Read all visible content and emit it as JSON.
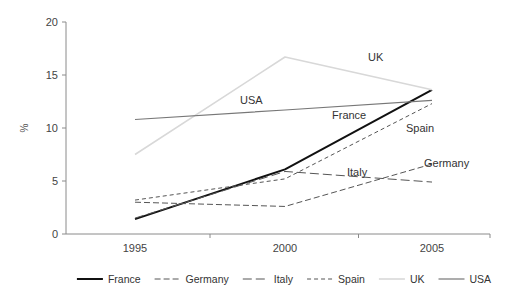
{
  "chart_data": {
    "type": "line",
    "title": "",
    "xlabel": "",
    "ylabel": "%",
    "x": [
      1995,
      2000,
      2005
    ],
    "categories": [
      "1995",
      "2000",
      "2005"
    ],
    "xtick_labels": [
      "1995",
      "2000",
      "2005"
    ],
    "ytick_labels": [
      "0",
      "5",
      "10",
      "15",
      "20"
    ],
    "ytick_values": [
      0,
      5,
      10,
      15,
      20
    ],
    "xlim": [
      1995,
      2005
    ],
    "ylim": [
      0,
      20
    ],
    "grid": false,
    "legend_position": "bottom",
    "series": [
      {
        "name": "France",
        "values": [
          1.4,
          6.1,
          13.6
        ],
        "style": "solid",
        "color": "#111111",
        "width": 2.0
      },
      {
        "name": "Germany",
        "values": [
          3.0,
          2.6,
          6.6
        ],
        "style": "dashdot",
        "color": "#555555",
        "width": 1.0
      },
      {
        "name": "Italy",
        "values": [
          1.5,
          5.9,
          4.9
        ],
        "style": "longdash",
        "color": "#555555",
        "width": 1.0
      },
      {
        "name": "Spain",
        "values": [
          3.2,
          5.2,
          12.3
        ],
        "style": "shortdash",
        "color": "#555555",
        "width": 1.0
      },
      {
        "name": "UK",
        "values": [
          7.5,
          16.7,
          13.6
        ],
        "style": "solid",
        "color": "#d8d8d8",
        "width": 1.6
      },
      {
        "name": "USA",
        "values": [
          10.8,
          11.7,
          12.6
        ],
        "style": "solid",
        "color": "#777777",
        "width": 1.2
      }
    ],
    "inline_annotations": [
      {
        "text": "UK",
        "x": 368,
        "y": 61
      },
      {
        "text": "USA",
        "x": 240,
        "y": 104
      },
      {
        "text": "France",
        "x": 332,
        "y": 119
      },
      {
        "text": "Spain",
        "x": 406,
        "y": 132
      },
      {
        "text": "Germany",
        "x": 424,
        "y": 167
      },
      {
        "text": "Italy",
        "x": 347,
        "y": 176
      }
    ]
  },
  "legend": {
    "entries": [
      {
        "label": "France"
      },
      {
        "label": "Germany"
      },
      {
        "label": "Italy"
      },
      {
        "label": "Spain"
      },
      {
        "label": "UK"
      },
      {
        "label": "USA"
      }
    ]
  }
}
